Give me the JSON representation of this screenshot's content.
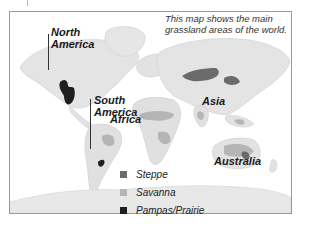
{
  "map": {
    "description": [
      "This map shows the main",
      "grassland areas of the world."
    ],
    "regions": {
      "north_america": [
        "North",
        "America"
      ],
      "south_america": [
        "South",
        "America"
      ],
      "africa": "Africa",
      "asia": "Asia",
      "australia": "Australia"
    },
    "legend": [
      {
        "label": "Steppe",
        "color": "#6b6b6b"
      },
      {
        "label": "Savanna",
        "color": "#b5b5b5"
      },
      {
        "label": "Pampas/Prairie",
        "color": "#1e1e1e"
      }
    ],
    "colors": {
      "land": "#e4e4e4",
      "land_edge": "#cfcfcf",
      "steppe": "#6b6b6b",
      "savanna": "#b5b5b5",
      "pampas": "#1e1e1e",
      "frame": "#9a9a9a"
    }
  }
}
